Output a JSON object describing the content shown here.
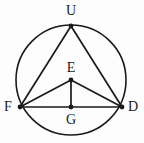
{
  "figure": {
    "kind": "circle-geometry-diagram",
    "background_color": "#fdfdfd",
    "stroke_color": "#1a1a1a",
    "label_color": "#1a1a1a",
    "width": 144,
    "height": 143,
    "circle": {
      "name": "circumcircle",
      "cx": 71,
      "cy": 80,
      "r": 55,
      "stroke_width": 1.6
    },
    "points": [
      {
        "id": "U",
        "label": "U",
        "x": 71,
        "y": 26,
        "dot": true,
        "label_x": 71,
        "label_y": 11
      },
      {
        "id": "E",
        "label": "E",
        "x": 71,
        "y": 80,
        "dot": true,
        "label_x": 71,
        "label_y": 68
      },
      {
        "id": "F",
        "label": "F",
        "x": 20,
        "y": 107,
        "dot": true,
        "label_x": 8,
        "label_y": 107
      },
      {
        "id": "D",
        "label": "D",
        "x": 122,
        "y": 107,
        "dot": true,
        "label_x": 133,
        "label_y": 107
      },
      {
        "id": "G",
        "label": "G",
        "x": 71,
        "y": 107,
        "dot": true,
        "label_x": 71,
        "label_y": 120
      }
    ],
    "segments": [
      {
        "id": "UF",
        "from": "U",
        "to": "F",
        "x1": 71,
        "y1": 26,
        "x2": 20,
        "y2": 107,
        "stroke_width": 1.7
      },
      {
        "id": "UD",
        "from": "U",
        "to": "D",
        "x1": 71,
        "y1": 26,
        "x2": 122,
        "y2": 107,
        "stroke_width": 1.7
      },
      {
        "id": "FD",
        "from": "F",
        "to": "D",
        "x1": 20,
        "y1": 107,
        "x2": 122,
        "y2": 107,
        "stroke_width": 1.7
      },
      {
        "id": "FE",
        "from": "F",
        "to": "E",
        "x1": 20,
        "y1": 107,
        "x2": 71,
        "y2": 80,
        "stroke_width": 1.7
      },
      {
        "id": "ED",
        "from": "E",
        "to": "D",
        "x1": 71,
        "y1": 80,
        "x2": 122,
        "y2": 107,
        "stroke_width": 1.7
      },
      {
        "id": "EG",
        "from": "E",
        "to": "G",
        "x1": 71,
        "y1": 80,
        "x2": 71,
        "y2": 107,
        "stroke_width": 1.7
      }
    ],
    "dot_radius": 2.4
  }
}
